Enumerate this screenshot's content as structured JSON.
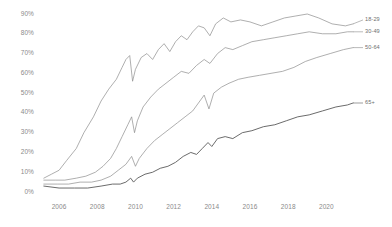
{
  "chart_data": {
    "type": "line",
    "title": "",
    "subtitle": "",
    "xlabel": "",
    "ylabel": "",
    "xlim": [
      2005.0,
      2021.5
    ],
    "ylim": [
      0,
      90
    ],
    "grid": false,
    "legend_position": "right-of-line-end",
    "y_ticks": [
      "0%",
      "10%",
      "20%",
      "30%",
      "40%",
      "50%",
      "60%",
      "70%",
      "80%",
      "90%"
    ],
    "y_tick_values": [
      0,
      10,
      20,
      30,
      40,
      50,
      60,
      70,
      80,
      90
    ],
    "x_ticks": [
      "2006",
      "2008",
      "2010",
      "2012",
      "2014",
      "2016",
      "2018",
      "2020"
    ],
    "x_tick_values": [
      2006,
      2008,
      2010,
      2012,
      2014,
      2016,
      2018,
      2020
    ],
    "series": [
      {
        "name": "18-29",
        "color": "#8c8c8c",
        "label_x": 2021.7,
        "label_y": 87,
        "points": [
          [
            2005.2,
            7
          ],
          [
            2005.6,
            9
          ],
          [
            2006.0,
            11
          ],
          [
            2006.4,
            16
          ],
          [
            2006.9,
            22
          ],
          [
            2007.3,
            30
          ],
          [
            2007.8,
            38
          ],
          [
            2008.2,
            46
          ],
          [
            2008.6,
            52
          ],
          [
            2009.0,
            57
          ],
          [
            2009.3,
            63
          ],
          [
            2009.5,
            67
          ],
          [
            2009.7,
            69
          ],
          [
            2009.85,
            56
          ],
          [
            2010.0,
            62
          ],
          [
            2010.3,
            68
          ],
          [
            2010.6,
            70
          ],
          [
            2010.9,
            67
          ],
          [
            2011.2,
            72
          ],
          [
            2011.5,
            75
          ],
          [
            2011.8,
            71
          ],
          [
            2012.1,
            76
          ],
          [
            2012.4,
            79
          ],
          [
            2012.7,
            77
          ],
          [
            2013.0,
            81
          ],
          [
            2013.3,
            84
          ],
          [
            2013.6,
            83
          ],
          [
            2013.9,
            79
          ],
          [
            2014.2,
            85
          ],
          [
            2014.6,
            88
          ],
          [
            2015.0,
            86
          ],
          [
            2015.5,
            87
          ],
          [
            2016.0,
            86
          ],
          [
            2016.6,
            84
          ],
          [
            2017.2,
            86
          ],
          [
            2017.8,
            88
          ],
          [
            2018.4,
            89
          ],
          [
            2019.0,
            90
          ],
          [
            2019.6,
            88
          ],
          [
            2020.3,
            85
          ],
          [
            2021.0,
            84
          ],
          [
            2021.4,
            85
          ]
        ]
      },
      {
        "name": "30-49",
        "color": "#8c8c8c",
        "label_x": 2021.7,
        "label_y": 81,
        "points": [
          [
            2005.2,
            6
          ],
          [
            2005.8,
            6
          ],
          [
            2006.3,
            6
          ],
          [
            2006.9,
            7
          ],
          [
            2007.4,
            8
          ],
          [
            2007.9,
            10
          ],
          [
            2008.3,
            13
          ],
          [
            2008.7,
            17
          ],
          [
            2009.0,
            22
          ],
          [
            2009.3,
            28
          ],
          [
            2009.6,
            34
          ],
          [
            2009.8,
            38
          ],
          [
            2009.95,
            30
          ],
          [
            2010.1,
            36
          ],
          [
            2010.4,
            43
          ],
          [
            2010.8,
            48
          ],
          [
            2011.2,
            52
          ],
          [
            2011.6,
            55
          ],
          [
            2012.0,
            58
          ],
          [
            2012.4,
            61
          ],
          [
            2012.8,
            60
          ],
          [
            2013.2,
            64
          ],
          [
            2013.6,
            67
          ],
          [
            2013.9,
            65
          ],
          [
            2014.3,
            70
          ],
          [
            2014.7,
            73
          ],
          [
            2015.1,
            72
          ],
          [
            2015.6,
            74
          ],
          [
            2016.1,
            76
          ],
          [
            2016.7,
            77
          ],
          [
            2017.3,
            78
          ],
          [
            2017.9,
            79
          ],
          [
            2018.5,
            80
          ],
          [
            2019.1,
            81
          ],
          [
            2019.8,
            80
          ],
          [
            2020.5,
            80
          ],
          [
            2021.1,
            81
          ],
          [
            2021.4,
            81
          ]
        ]
      },
      {
        "name": "50-64",
        "color": "#8c8c8c",
        "label_x": 2021.7,
        "label_y": 73,
        "points": [
          [
            2005.2,
            4
          ],
          [
            2005.9,
            4
          ],
          [
            2006.5,
            4
          ],
          [
            2007.1,
            5
          ],
          [
            2007.7,
            5
          ],
          [
            2008.2,
            6
          ],
          [
            2008.7,
            8
          ],
          [
            2009.1,
            11
          ],
          [
            2009.5,
            14
          ],
          [
            2009.8,
            18
          ],
          [
            2010.0,
            13
          ],
          [
            2010.2,
            17
          ],
          [
            2010.6,
            22
          ],
          [
            2011.0,
            26
          ],
          [
            2011.4,
            29
          ],
          [
            2011.8,
            32
          ],
          [
            2012.2,
            35
          ],
          [
            2012.6,
            38
          ],
          [
            2013.0,
            41
          ],
          [
            2013.3,
            45
          ],
          [
            2013.6,
            49
          ],
          [
            2013.85,
            42
          ],
          [
            2014.1,
            50
          ],
          [
            2014.5,
            53
          ],
          [
            2014.9,
            55
          ],
          [
            2015.4,
            57
          ],
          [
            2015.9,
            58
          ],
          [
            2016.5,
            59
          ],
          [
            2017.1,
            60
          ],
          [
            2017.7,
            61
          ],
          [
            2018.3,
            63
          ],
          [
            2018.9,
            66
          ],
          [
            2019.5,
            68
          ],
          [
            2020.2,
            70
          ],
          [
            2020.9,
            72
          ],
          [
            2021.4,
            73
          ]
        ]
      },
      {
        "name": "65+",
        "color": "#5a5a5a",
        "label_x": 2021.7,
        "label_y": 45,
        "points": [
          [
            2005.2,
            3
          ],
          [
            2006.0,
            2
          ],
          [
            2006.8,
            2
          ],
          [
            2007.5,
            2
          ],
          [
            2008.2,
            3
          ],
          [
            2008.8,
            4
          ],
          [
            2009.2,
            4
          ],
          [
            2009.5,
            5
          ],
          [
            2009.75,
            7
          ],
          [
            2009.9,
            5
          ],
          [
            2010.1,
            7
          ],
          [
            2010.5,
            9
          ],
          [
            2010.9,
            10
          ],
          [
            2011.3,
            12
          ],
          [
            2011.7,
            13
          ],
          [
            2012.1,
            15
          ],
          [
            2012.5,
            18
          ],
          [
            2012.9,
            20
          ],
          [
            2013.2,
            19
          ],
          [
            2013.5,
            22
          ],
          [
            2013.8,
            25
          ],
          [
            2014.0,
            23
          ],
          [
            2014.3,
            27
          ],
          [
            2014.7,
            28
          ],
          [
            2015.1,
            27
          ],
          [
            2015.6,
            30
          ],
          [
            2016.1,
            31
          ],
          [
            2016.7,
            33
          ],
          [
            2017.3,
            34
          ],
          [
            2017.9,
            36
          ],
          [
            2018.5,
            38
          ],
          [
            2019.1,
            39
          ],
          [
            2019.8,
            41
          ],
          [
            2020.5,
            43
          ],
          [
            2021.1,
            44
          ],
          [
            2021.4,
            45
          ]
        ]
      }
    ]
  },
  "plot_geometry": {
    "left": 40,
    "right": 355,
    "top": 14,
    "bottom": 192
  }
}
